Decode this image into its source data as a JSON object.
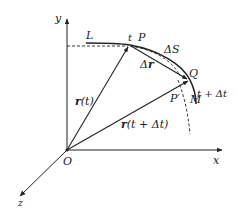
{
  "diagram": {
    "type": "kinematics-displacement-vector",
    "colors": {
      "ink": "#222222",
      "background": "#ffffff"
    },
    "axes": {
      "y_label": "y",
      "x_label": "x",
      "z_label": "z",
      "origin_label": "O"
    },
    "curve": {
      "label": "L"
    },
    "points": {
      "P": {
        "label": "P",
        "time_label": "t"
      },
      "Q": {
        "label": "Q",
        "time_label": "t + Δt"
      },
      "P_prime": {
        "label": "P′"
      },
      "M": {
        "label": "M"
      }
    },
    "vectors": {
      "r_t": {
        "label_bold": "r",
        "label_rest": "(t)"
      },
      "r_t_dt": {
        "label_bold": "r",
        "label_rest": "(t + Δt)"
      },
      "delta_r": {
        "label_prefix": "Δ",
        "label_bold": "r"
      }
    },
    "arc": {
      "delta_s_label": "ΔS"
    }
  }
}
